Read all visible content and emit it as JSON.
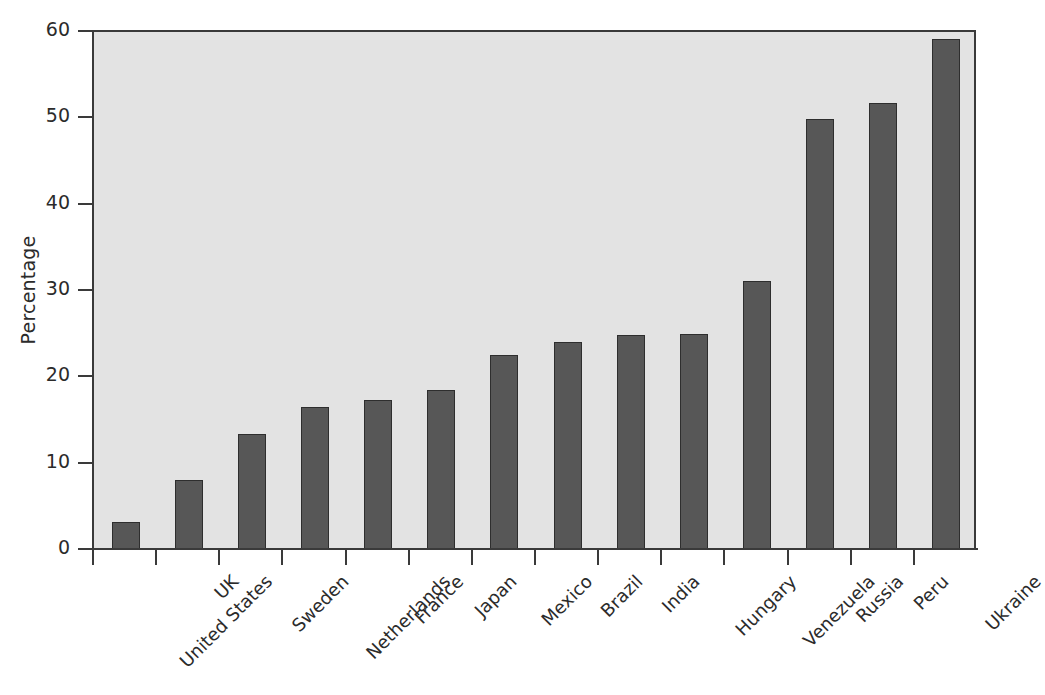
{
  "chart_data": {
    "type": "bar",
    "title": "",
    "subtitle": "",
    "xlabel": "",
    "ylabel": "Percentage",
    "ylim": [
      0,
      60
    ],
    "yticks": [
      0,
      10,
      20,
      30,
      40,
      50,
      60
    ],
    "ytick_labels": [
      "0",
      "10",
      "20",
      "30",
      "40",
      "50",
      "60"
    ],
    "grid": false,
    "legend": null,
    "categories": [
      "United States",
      "UK",
      "Sweden",
      "Netherlands",
      "France",
      "Japan",
      "Mexico",
      "Brazil",
      "India",
      "Hungary",
      "Venezuela",
      "Russia",
      "Peru",
      "Ukraine"
    ],
    "values": [
      3.1,
      8.0,
      13.3,
      16.4,
      17.3,
      18.4,
      22.5,
      24.0,
      24.8,
      24.9,
      31.1,
      49.8,
      51.7,
      59.1
    ],
    "series": [
      {
        "name": "Percentage",
        "values": [
          3.1,
          8.0,
          13.3,
          16.4,
          17.3,
          18.4,
          22.5,
          24.0,
          24.8,
          24.9,
          31.1,
          49.8,
          51.7,
          59.1
        ]
      }
    ],
    "annotations": []
  },
  "style": {
    "bar_color": "#575757",
    "bar_edge_color": "#2e2e2e",
    "plot_background": "#e3e3e3",
    "figure_background": "#ffffff",
    "axis_color": "#3a3a3a",
    "text_color": "#2b2b2b"
  }
}
